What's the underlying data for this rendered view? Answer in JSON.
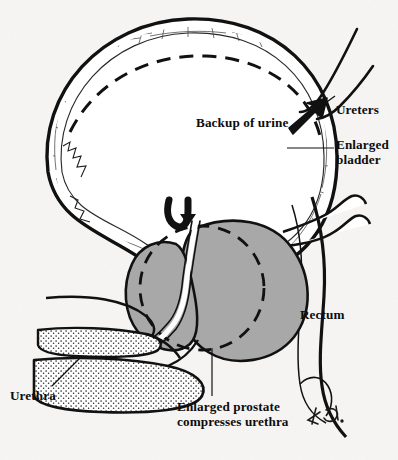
{
  "figure": {
    "medium": "pen-and-ink anatomical line drawing, sagittal section",
    "background_color": "#f6f5f3",
    "ink_color": "#111111",
    "prostate_fill_color": "#a8a8a8",
    "artist_signature": "KG"
  },
  "labels": {
    "ureters": "Ureters",
    "backup_of_urine": "Backup of urine",
    "enlarged_bladder": "Enlarged\nbladder",
    "rectum": "Rectum",
    "urethra": "Urethra",
    "enlarged_prostate": "Enlarged prostate\ncompresses urethra"
  },
  "structures": [
    {
      "name": "bladder",
      "label": "Enlarged bladder",
      "description": "Greatly distended bladder drawn as a large oval with a thick hatched muscular wall; a dashed inner contour marks the normal (non-distended) bladder outline."
    },
    {
      "name": "ureters",
      "label": "Ureters",
      "description": "Two tubes descending from upper right toward the bladder, dilated because urine backs up."
    },
    {
      "name": "backup-of-urine",
      "label": "Backup of urine",
      "description": "Bold solid arrow pointing up and to the right along the ureter, indicating retrograde flow of urine."
    },
    {
      "name": "obstruction-arrow",
      "label": "",
      "description": "Bold hooked arrow at the bladder neck curving downward, showing blocked outflow at the prostatic urethra."
    },
    {
      "name": "prostate",
      "label": "Enlarged prostate compresses urethra",
      "description": "Gray-filled two-lobed mass beneath the bladder neck; a dashed circle indicates the normal prostate size for comparison."
    },
    {
      "name": "urethra",
      "label": "Urethra",
      "description": "Narrow channel squeezed between the prostate lobes, continuing forward into the stippled penile shaft."
    },
    {
      "name": "rectum",
      "label": "Rectum",
      "description": "Tube outlined behind the prostate, descending to the lower right of the drawing."
    }
  ],
  "leader_lines": [
    {
      "name": "ureters-leader",
      "from": "Ureters",
      "to": "ureter tubes"
    },
    {
      "name": "enlarged-bladder-leader",
      "from": "Enlarged bladder",
      "to": "bladder wall"
    },
    {
      "name": "urethra-leader",
      "from": "Urethra",
      "to": "penile urethra"
    },
    {
      "name": "prostate-leader",
      "from": "Enlarged prostate compresses urethra",
      "to": "prostate mass"
    }
  ]
}
